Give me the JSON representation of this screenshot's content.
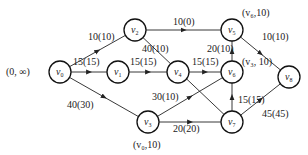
{
  "diagram": {
    "type": "network-flow",
    "nodes": [
      {
        "id": "v0",
        "name": "v",
        "sub": "0",
        "x": 60,
        "y": 72
      },
      {
        "id": "v1",
        "name": "v",
        "sub": "1",
        "x": 118,
        "y": 72
      },
      {
        "id": "v2",
        "name": "v",
        "sub": "2",
        "x": 135,
        "y": 30
      },
      {
        "id": "v3",
        "name": "v",
        "sub": "3",
        "x": 148,
        "y": 122
      },
      {
        "id": "v4",
        "name": "v",
        "sub": "4",
        "x": 178,
        "y": 72
      },
      {
        "id": "v5",
        "name": "v",
        "sub": "5",
        "x": 232,
        "y": 30
      },
      {
        "id": "v6",
        "name": "v",
        "sub": "6",
        "x": 232,
        "y": 72
      },
      {
        "id": "v7",
        "name": "v",
        "sub": "7",
        "x": 232,
        "y": 122
      },
      {
        "id": "v8",
        "name": "v",
        "sub": "8",
        "x": 289,
        "y": 77
      }
    ],
    "edges": [
      {
        "from": "v0",
        "to": "v2",
        "label": "10(10)",
        "lx": 88,
        "ly": 40
      },
      {
        "from": "v0",
        "to": "v1",
        "label": "15(15)",
        "lx": 73,
        "ly": 65
      },
      {
        "from": "v0",
        "to": "v3",
        "label": "40(30)",
        "lx": 67,
        "ly": 108
      },
      {
        "from": "v1",
        "to": "v4",
        "label": "15(15)",
        "lx": 130,
        "ly": 65
      },
      {
        "from": "v2",
        "to": "v5",
        "label": "10(0)",
        "lx": 173,
        "ly": 25
      },
      {
        "from": "v7",
        "to": "v2",
        "label": "40(10)",
        "lx": 142,
        "ly": 52
      },
      {
        "from": "v4",
        "to": "v6",
        "label": "15(15)",
        "lx": 192,
        "ly": 65
      },
      {
        "from": "v3",
        "to": "v6",
        "label": "30(10)",
        "lx": 152,
        "ly": 100
      },
      {
        "from": "v3",
        "to": "v7",
        "label": "20(20)",
        "lx": 173,
        "ly": 132
      },
      {
        "from": "v6",
        "to": "v5",
        "label": "20(10)",
        "lx": 207,
        "ly": 52
      },
      {
        "from": "v7",
        "to": "v6",
        "label": "15(15)",
        "lx": 238,
        "ly": 103
      },
      {
        "from": "v5",
        "to": "v8",
        "label": "10(10)",
        "lx": 262,
        "ly": 40
      },
      {
        "from": "v7",
        "to": "v8",
        "label": "45(45)",
        "lx": 262,
        "ly": 117
      }
    ],
    "node_labels": [
      {
        "text": "(0, ∞)",
        "x": 6,
        "y": 75
      },
      {
        "text": "(v₀,10)",
        "x": 133,
        "y": 148
      },
      {
        "text": "(v₆,10)",
        "x": 242,
        "y": 16
      },
      {
        "text": "(v₃, 10)",
        "x": 242,
        "y": 65
      }
    ]
  }
}
